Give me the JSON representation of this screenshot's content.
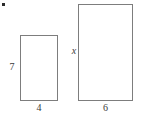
{
  "figure": {
    "type": "geometry-diagram",
    "background_color": "#ffffff",
    "stroke_color": "#7d7d7d",
    "text_color": "#3a3a3a",
    "bullet": {
      "name": "problem-bullet",
      "color": "#2b2b2b"
    },
    "shapes": [
      {
        "name": "small-rectangle",
        "kind": "rectangle",
        "labels": {
          "height": "7",
          "width": "4"
        }
      },
      {
        "name": "large-rectangle",
        "kind": "rectangle",
        "labels": {
          "height": "x",
          "width": "6"
        }
      }
    ]
  },
  "chart_data": {
    "type": "table",
    "title": "",
    "columns": [
      "shape",
      "width",
      "height"
    ],
    "rows": [
      [
        "small-rectangle",
        "4",
        "7"
      ],
      [
        "large-rectangle",
        "6",
        "x"
      ]
    ],
    "annotations": [
      "7",
      "4",
      "x",
      "6"
    ]
  }
}
